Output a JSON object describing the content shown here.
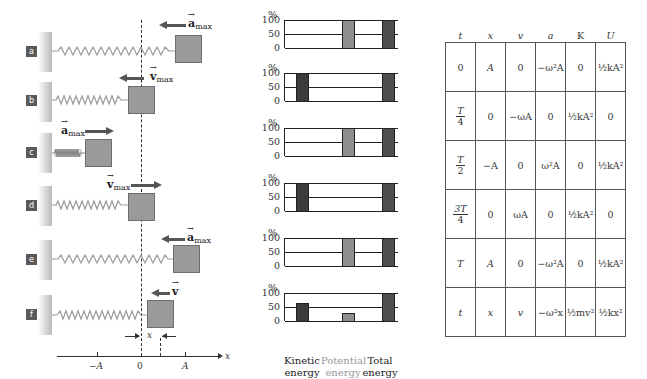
{
  "panels": [
    {
      "id": "a",
      "label": "a",
      "vector": "a",
      "vector_sub": "max",
      "direction": "left",
      "block_x": 175,
      "spring_end": 175,
      "compressed": false
    },
    {
      "id": "b",
      "label": "b",
      "vector": "v",
      "vector_sub": "max",
      "direction": "left",
      "block_x": 127,
      "spring_end": 127,
      "compressed": false
    },
    {
      "id": "c",
      "label": "c",
      "vector": "a",
      "vector_sub": "max",
      "direction": "right",
      "block_x": 85,
      "spring_end": 85,
      "compressed": true
    },
    {
      "id": "d",
      "label": "d",
      "vector": "v",
      "vector_sub": "max",
      "direction": "right",
      "block_x": 127,
      "spring_end": 127,
      "compressed": false
    },
    {
      "id": "e",
      "label": "e",
      "vector": "a",
      "vector_sub": "max",
      "direction": "left",
      "block_x": 173,
      "spring_end": 173,
      "compressed": false
    },
    {
      "id": "f",
      "label": "f",
      "vector": "v",
      "vector_sub": "",
      "direction": "left",
      "block_x": 147,
      "spring_end": 147,
      "compressed": false
    }
  ],
  "axis": {
    "label": "x",
    "ticks": [
      {
        "label": "−A"
      },
      {
        "label": "0"
      },
      {
        "label": "A"
      }
    ],
    "displacement_label": "x"
  },
  "chart_data": {
    "type": "bar",
    "categories": [
      "Kinetic energy",
      "Potential energy",
      "Total energy"
    ],
    "ylabel": "%",
    "yticks": [
      0,
      50,
      100
    ],
    "ylim": [
      0,
      100
    ],
    "series": [
      {
        "name": "a",
        "values": [
          0,
          100,
          100
        ]
      },
      {
        "name": "b",
        "values": [
          100,
          0,
          100
        ]
      },
      {
        "name": "c",
        "values": [
          0,
          100,
          100
        ]
      },
      {
        "name": "d",
        "values": [
          100,
          0,
          100
        ]
      },
      {
        "name": "e",
        "values": [
          0,
          100,
          100
        ]
      },
      {
        "name": "f",
        "values": [
          65,
          30,
          100
        ]
      }
    ]
  },
  "charts": {
    "pct": "%",
    "y100": "100",
    "y50": "50",
    "y0": "0",
    "labels": {
      "kinetic_1": "Kinetic",
      "kinetic_2": "energy",
      "potential_1": "Potential",
      "potential_2": "energy",
      "total_1": "Total",
      "total_2": "energy"
    },
    "colors": {
      "kinetic": "#3c3c3c",
      "potential": "#8e8e8e",
      "total": "#4e4e4e",
      "potential_label": "#999999"
    }
  },
  "table": {
    "headers": [
      "t",
      "x",
      "v",
      "a",
      "K",
      "U"
    ],
    "rows": [
      [
        "0",
        "A",
        "0",
        "−ω²A",
        "0",
        "½kA²"
      ],
      [
        "T/4",
        "0",
        "−ωA",
        "0",
        "½kA²",
        "0"
      ],
      [
        "T/2",
        "−A",
        "0",
        "ω²A",
        "0",
        "½kA²"
      ],
      [
        "3T/4",
        "0",
        "ωA",
        "0",
        "½kA²",
        "0"
      ],
      [
        "T",
        "A",
        "0",
        "−ω²A",
        "0",
        "½kA²"
      ],
      [
        "t",
        "x",
        "v",
        "−ω²x",
        "½mv²",
        "½kx²"
      ]
    ]
  }
}
